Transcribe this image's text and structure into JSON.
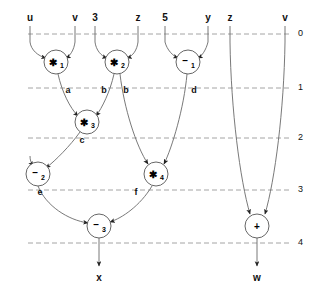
{
  "figure": {
    "width": 315,
    "height": 306,
    "background": "#ffffff",
    "line_color": "#555555",
    "dash_color": "#999999",
    "text_color": "#111111"
  },
  "levels": [
    {
      "label": "0",
      "y": 34,
      "num_x": 298,
      "num_y": 29
    },
    {
      "label": "1",
      "y": 88,
      "num_x": 298,
      "num_y": 83
    },
    {
      "label": "2",
      "y": 138,
      "num_x": 298,
      "num_y": 133
    },
    {
      "label": "3",
      "y": 190,
      "num_x": 298,
      "num_y": 185
    },
    {
      "label": "4",
      "y": 243,
      "num_x": 298,
      "num_y": 238
    }
  ],
  "inputs": [
    {
      "name": "u",
      "x": 30,
      "y": 16,
      "stem_x": 30
    },
    {
      "name": "v",
      "x": 75,
      "y": 16,
      "stem_x": 75
    },
    {
      "name": "3",
      "x": 95,
      "y": 16,
      "stem_x": 95
    },
    {
      "name": "z",
      "x": 138,
      "y": 16,
      "stem_x": 138
    },
    {
      "name": "5",
      "x": 165,
      "y": 16,
      "stem_x": 165
    },
    {
      "name": "y",
      "x": 208,
      "y": 16,
      "stem_x": 208
    },
    {
      "name": "z",
      "x": 230,
      "y": 16,
      "stem_x": 230
    },
    {
      "name": "v",
      "x": 285,
      "y": 16,
      "stem_x": 285
    }
  ],
  "outputs": [
    {
      "name": "x",
      "x": 99,
      "y": 277
    },
    {
      "name": "w",
      "x": 257,
      "y": 277
    }
  ],
  "nodes": [
    {
      "id": "m1",
      "op": "*",
      "sub": "1",
      "cx": 56,
      "cy": 62,
      "r": 12
    },
    {
      "id": "m2",
      "op": "*",
      "sub": "2",
      "cx": 117,
      "cy": 62,
      "r": 12
    },
    {
      "id": "s1",
      "op": "-",
      "sub": "1",
      "cx": 188,
      "cy": 62,
      "r": 12
    },
    {
      "id": "m3",
      "op": "*",
      "sub": "3",
      "cx": 87,
      "cy": 122,
      "r": 12
    },
    {
      "id": "s2",
      "op": "-",
      "sub": "2",
      "cx": 38,
      "cy": 174,
      "r": 12
    },
    {
      "id": "m4",
      "op": "*",
      "sub": "4",
      "cx": 156,
      "cy": 174,
      "r": 12
    },
    {
      "id": "s3",
      "op": "-",
      "sub": "3",
      "cx": 99,
      "cy": 226,
      "r": 12
    },
    {
      "id": "p1",
      "op": "+",
      "sub": "",
      "cx": 257,
      "cy": 226,
      "r": 12
    }
  ],
  "edge_labels": [
    {
      "name": "a",
      "x": 68,
      "y": 90
    },
    {
      "name": "b",
      "x": 104,
      "y": 90
    },
    {
      "name": "b",
      "x": 126,
      "y": 90
    },
    {
      "name": "d",
      "x": 194,
      "y": 90
    },
    {
      "name": "c",
      "x": 82,
      "y": 140
    },
    {
      "name": "e",
      "x": 40,
      "y": 192
    },
    {
      "name": "f",
      "x": 136,
      "y": 192
    }
  ]
}
